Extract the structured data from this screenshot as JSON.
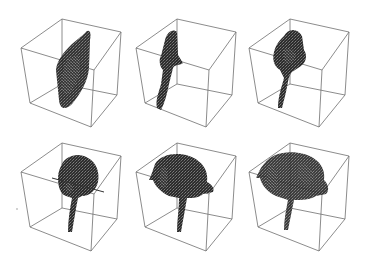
{
  "figure": {
    "layout": {
      "rows": 2,
      "cols": 3
    },
    "colors": {
      "background": "#ffffff",
      "box_edge": "#6e6e6e",
      "volume": "#1c1c1c",
      "volume_highlight": "#8a8a8a"
    },
    "panels": [
      {
        "id": 1,
        "row": 0,
        "col": 0,
        "shape": "flat-sheet",
        "offset": [
          0,
          0
        ]
      },
      {
        "id": 2,
        "row": 0,
        "col": 1,
        "shape": "thin-stalk",
        "offset": [
          115,
          0
        ]
      },
      {
        "id": 3,
        "row": 0,
        "col": 2,
        "shape": "bell-with-stalk",
        "offset": [
          228,
          0
        ]
      },
      {
        "id": 4,
        "row": 1,
        "col": 0,
        "shape": "cap-with-stalk",
        "offset": [
          0,
          124
        ]
      },
      {
        "id": 5,
        "row": 1,
        "col": 1,
        "shape": "rolled-cap",
        "offset": [
          115,
          124
        ]
      },
      {
        "id": 6,
        "row": 1,
        "col": 2,
        "shape": "full-roll",
        "offset": [
          228,
          124
        ]
      }
    ]
  }
}
